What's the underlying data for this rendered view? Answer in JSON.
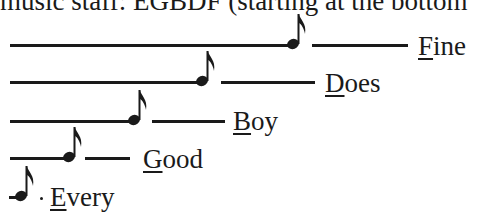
{
  "caption": "music staff: EGBDF (starting at the bottom",
  "mnemonic": [
    {
      "word": "Fine",
      "initial": "F",
      "rest": "ine",
      "note_letter": "F"
    },
    {
      "word": "Does",
      "initial": "D",
      "rest": "oes",
      "note_letter": "D"
    },
    {
      "word": "Boy",
      "initial": "B",
      "rest": "oy",
      "note_letter": "B"
    },
    {
      "word": "Good",
      "initial": "G",
      "rest": "ood",
      "note_letter": "G"
    },
    {
      "word": "Every",
      "initial": "E",
      "rest": "very",
      "note_letter": "E"
    }
  ],
  "icons": {
    "note": "eighth-note-icon"
  }
}
